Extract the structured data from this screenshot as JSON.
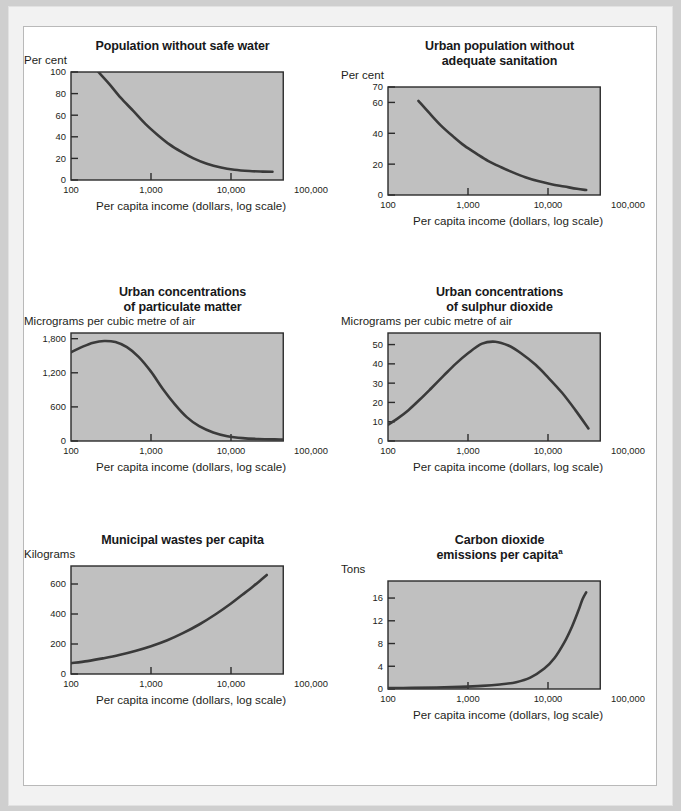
{
  "page": {
    "background": "#cfcfcf",
    "sheet_background": "#ffffff",
    "plot_background": "#c0c0c0",
    "curve_color": "#3a3a3a",
    "axis_color": "#2b2b2b"
  },
  "shared": {
    "x_caption": "Per capita income (dollars, log scale)",
    "x_ticklabels": [
      "100",
      "1,000",
      "10,000",
      "100,000"
    ],
    "x_tickvalues": [
      100,
      1000,
      10000,
      100000
    ]
  },
  "chart_data": [
    {
      "id": "population-without-safe-water",
      "type": "line",
      "title": "Population without safe water",
      "title_lines": [
        "Population without safe water"
      ],
      "ylabel": "Per cent",
      "xlabel": "Per capita income (dollars, log scale)",
      "xlim": [
        100,
        50000
      ],
      "ylim": [
        0,
        100
      ],
      "xscale": "log",
      "yticks": [
        0,
        20,
        40,
        60,
        80,
        100
      ],
      "yticklabels": [
        "0",
        "20",
        "40",
        "60",
        "80",
        "100"
      ],
      "xticklabels": [
        "100",
        "1,000",
        "10,000",
        "100,000"
      ],
      "grid": false,
      "legend": "none",
      "x": [
        220,
        300,
        420,
        600,
        850,
        1200,
        1700,
        2400,
        3400,
        5000,
        7500,
        11000,
        17000,
        25000,
        33000
      ],
      "y": [
        100,
        89,
        76,
        64,
        52,
        42,
        33,
        26,
        20,
        15,
        11.5,
        9.5,
        8.3,
        7.8,
        7.6
      ]
    },
    {
      "id": "urban-population-without-adequate-sanitation",
      "type": "line",
      "title": "Urban population without adequate sanitation",
      "title_lines": [
        "Urban population without",
        "adequate sanitation"
      ],
      "ylabel": "Per cent",
      "xlabel": "Per capita income (dollars, log scale)",
      "xlim": [
        100,
        50000
      ],
      "ylim": [
        0,
        70
      ],
      "xscale": "log",
      "yticks": [
        0,
        20,
        40,
        60,
        70
      ],
      "yticklabels": [
        "0",
        "20",
        "40",
        "60",
        "70"
      ],
      "xticklabels": [
        "100",
        "1,000",
        "10,000",
        "100,000"
      ],
      "grid": false,
      "legend": "none",
      "x": [
        240,
        330,
        460,
        650,
        900,
        1300,
        1800,
        2600,
        3700,
        5200,
        7500,
        11000,
        16000,
        23000,
        30000
      ],
      "y": [
        61,
        53,
        45,
        38,
        32,
        26.5,
        22,
        18,
        14.5,
        11.5,
        9,
        7,
        5.5,
        4,
        3.2
      ]
    },
    {
      "id": "urban-concentrations-of-particulate-matter",
      "type": "line",
      "title": "Urban concentrations of particulate matter",
      "title_lines": [
        "Urban concentrations",
        "of particulate matter"
      ],
      "ylabel": "Micrograms per cubic metre of air",
      "xlabel": "Per capita income (dollars, log scale)",
      "xlim": [
        100,
        100000
      ],
      "ylim": [
        0,
        1900
      ],
      "xscale": "log",
      "yticks": [
        0,
        600,
        1200,
        1800
      ],
      "yticklabels": [
        "0",
        "600",
        "1,200",
        "1,800"
      ],
      "xticklabels": [
        "100",
        "1,000",
        "10,000",
        "100,000"
      ],
      "grid": false,
      "legend": "none",
      "x": [
        100,
        140,
        190,
        260,
        360,
        500,
        700,
        1000,
        1400,
        2000,
        2800,
        4000,
        6000,
        9000,
        14000,
        22000,
        35000,
        55000
      ],
      "y": [
        1560,
        1660,
        1730,
        1760,
        1740,
        1650,
        1480,
        1220,
        920,
        640,
        420,
        260,
        150,
        85,
        50,
        35,
        28,
        25
      ]
    },
    {
      "id": "urban-concentrations-of-sulphur-dioxide",
      "type": "line",
      "title": "Urban concentrations of sulphur dioxide",
      "title_lines": [
        "Urban concentrations",
        "of sulphur dioxide"
      ],
      "ylabel": "Micrograms per cubic metre of air",
      "xlabel": "Per capita income (dollars, log scale)",
      "xlim": [
        100,
        100000
      ],
      "ylim": [
        0,
        56
      ],
      "xscale": "log",
      "yticks": [
        0,
        10,
        20,
        30,
        40,
        50
      ],
      "yticklabels": [
        "0",
        "10",
        "20",
        "30",
        "40",
        "50"
      ],
      "xticklabels": [
        "100",
        "1,000",
        "10,000",
        "100,000"
      ],
      "grid": false,
      "legend": "none",
      "x": [
        100,
        130,
        180,
        250,
        350,
        500,
        700,
        1000,
        1500,
        2200,
        3200,
        4600,
        7000,
        10000,
        15000,
        22000,
        32000
      ],
      "y": [
        8.5,
        11.5,
        16,
        21.5,
        27.5,
        34,
        40,
        45.5,
        50.5,
        51.5,
        49.5,
        45.5,
        39.5,
        33,
        25,
        16,
        6.5
      ]
    },
    {
      "id": "municipal-wastes-per-capita",
      "type": "line",
      "title": "Municipal wastes per capita",
      "title_lines": [
        "Municipal wastes per capita"
      ],
      "ylabel": "Kilograms",
      "xlabel": "Per capita income (dollars, log scale)",
      "xlim": [
        100,
        100000
      ],
      "ylim": [
        0,
        720
      ],
      "xscale": "log",
      "yticks": [
        0,
        200,
        400,
        600
      ],
      "yticklabels": [
        "0",
        "200",
        "400",
        "600"
      ],
      "xticklabels": [
        "100",
        "1,000",
        "10,000",
        "100,000"
      ],
      "grid": false,
      "legend": "none",
      "x": [
        100,
        160,
        250,
        400,
        650,
        1000,
        1600,
        2500,
        4000,
        6500,
        10000,
        14000,
        19000,
        24000,
        28000
      ],
      "y": [
        72,
        86,
        104,
        126,
        155,
        185,
        225,
        272,
        330,
        400,
        470,
        530,
        585,
        630,
        660
      ]
    },
    {
      "id": "carbon-dioxide-emissions-per-capita",
      "type": "line",
      "title": "Carbon dioxide emissions per capita",
      "title_lines": [
        "Carbon dioxide",
        "emissions per capita"
      ],
      "title_superscript": "a",
      "ylabel": "Tons",
      "xlabel": "Per capita income (dollars, log scale)",
      "xlim": [
        100,
        100000
      ],
      "ylim": [
        0,
        19
      ],
      "xscale": "log",
      "yticks": [
        0,
        4,
        8,
        12,
        16
      ],
      "yticklabels": [
        "0",
        "4",
        "8",
        "12",
        "16"
      ],
      "xticklabels": [
        "100",
        "1,000",
        "10,000",
        "100,000"
      ],
      "grid": false,
      "legend": "none",
      "x": [
        100,
        200,
        400,
        800,
        1500,
        2500,
        4000,
        6000,
        9000,
        12000,
        16000,
        20000,
        24000,
        27000,
        30000
      ],
      "y": [
        0.15,
        0.2,
        0.27,
        0.38,
        0.55,
        0.8,
        1.2,
        2.0,
        3.6,
        5.4,
        8.2,
        11.0,
        13.8,
        15.8,
        17.0
      ]
    }
  ]
}
